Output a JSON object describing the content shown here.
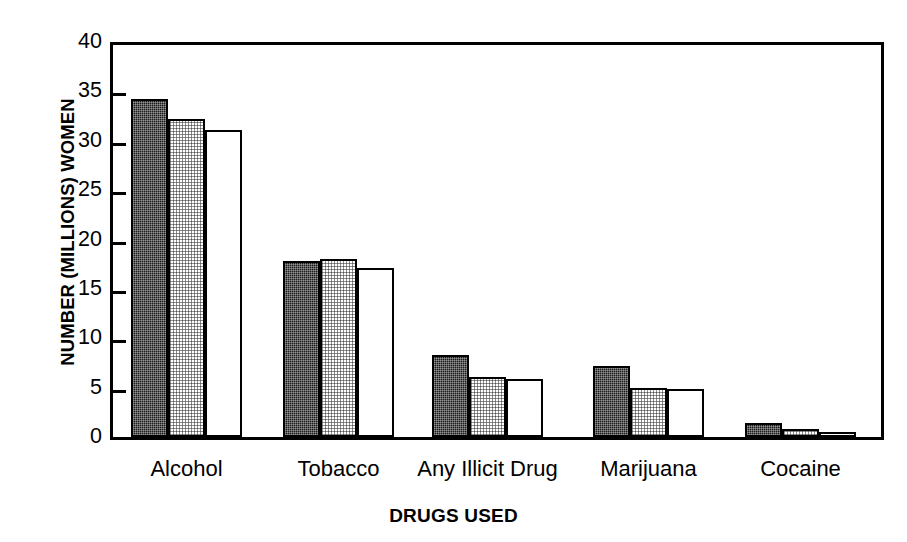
{
  "chart_data": {
    "type": "bar",
    "title": "",
    "xlabel": "DRUGS USED",
    "ylabel": "NUMBER (MILLIONS) WOMEN",
    "categories": [
      "Alcohol",
      "Tobacco",
      "Any Illicit Drug",
      "Marijuana",
      "Cocaine"
    ],
    "series": [
      {
        "name": "series-1-dark",
        "pattern": "dark-checker",
        "values": [
          34.2,
          17.8,
          8.3,
          7.2,
          1.4
        ]
      },
      {
        "name": "series-2-light",
        "pattern": "light-checker",
        "values": [
          32.2,
          18.0,
          6.1,
          5.0,
          0.8
        ]
      },
      {
        "name": "series-3-white",
        "pattern": "white",
        "values": [
          31.1,
          17.1,
          5.9,
          4.9,
          0.5
        ]
      }
    ],
    "ylim": [
      0,
      40
    ],
    "yticks": [
      0,
      5,
      10,
      15,
      20,
      25,
      30,
      35,
      40
    ],
    "ytick_labels": [
      "0",
      "5",
      "10",
      "15",
      "20",
      "25",
      "30",
      "35",
      "40"
    ],
    "grid": false,
    "legend": "none",
    "colors": {
      "axis": "#000000",
      "bar_dark": "#1b1b1b",
      "bar_light": "#d9d9d9",
      "bar_white": "#ffffff",
      "background": "#ffffff"
    }
  }
}
